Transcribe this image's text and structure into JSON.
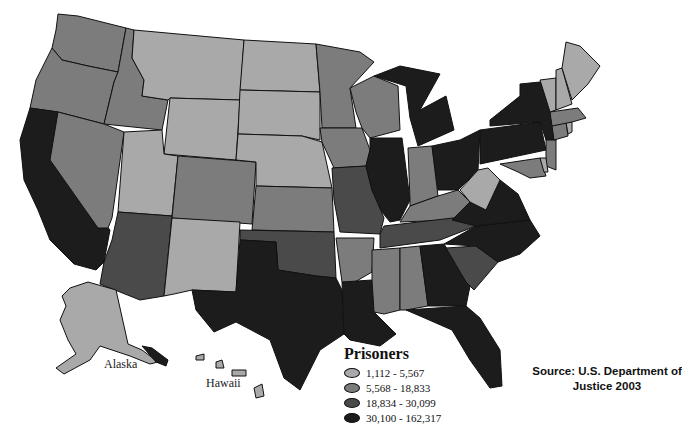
{
  "map": {
    "title": "Prisoners by State",
    "colors": {
      "tier1": "#a9a9a9",
      "tier2": "#7c7c7c",
      "tier3": "#4a4a4a",
      "tier4": "#1c1c1c"
    },
    "inset_labels": {
      "alaska": "Alaska",
      "hawaii": "Hawaii"
    },
    "states": {
      "tier1_1112_5567": [
        "Alaska",
        "Montana",
        "Wyoming",
        "North Dakota",
        "South Dakota",
        "Nebraska",
        "Utah",
        "New Mexico",
        "West Virginia",
        "Maine",
        "Vermont",
        "New Hampshire",
        "Rhode Island",
        "Hawaii",
        "Delaware"
      ],
      "tier2_5568_18833": [
        "Washington",
        "Oregon",
        "Idaho",
        "Nevada",
        "Colorado",
        "Kansas",
        "Iowa",
        "Minnesota",
        "Arkansas",
        "Kentucky",
        "Massachusetts",
        "Wisconsin",
        "Indiana",
        "Connecticut",
        "Maryland",
        "New Jersey",
        "Mississippi",
        "Alabama"
      ],
      "tier3_18834_30099": [
        "Arizona",
        "Oklahoma",
        "Missouri",
        "Tennessee",
        "South Carolina"
      ],
      "tier4_30100_162317": [
        "California",
        "Texas",
        "Louisiana",
        "Illinois",
        "Michigan",
        "Ohio",
        "Pennsylvania",
        "New York",
        "Virginia",
        "North Carolina",
        "Georgia",
        "Florida"
      ]
    }
  },
  "legend": {
    "title": "Prisoners",
    "items": [
      {
        "label": "1,112 - 5,567",
        "color": "#a9a9a9"
      },
      {
        "label": "5,568 - 18,833",
        "color": "#7c7c7c"
      },
      {
        "label": "18,834 - 30,099",
        "color": "#4a4a4a"
      },
      {
        "label": "30,100 - 162,317",
        "color": "#1c1c1c"
      }
    ]
  },
  "source": {
    "line1": "Source: U.S. Department of",
    "line2": "Justice 2003"
  }
}
